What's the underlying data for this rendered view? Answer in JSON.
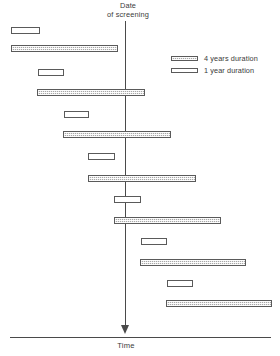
{
  "chart_data": {
    "type": "bar",
    "title": "Date of screening",
    "title_line1": "Date",
    "title_line2": "of screening",
    "xlabel": "Time",
    "ylabel": "",
    "grid": false,
    "orientation": "horizontal",
    "legend_position": "top-right",
    "screening_line_x": 126,
    "legend": [
      {
        "key": "four-year",
        "label": "4 years duration",
        "fill": "hatched-gray",
        "color": "#a8a8a8"
      },
      {
        "key": "one-year",
        "label": "1 year duration",
        "fill": "white",
        "color": "#ffffff"
      }
    ],
    "categories": [
      "case-1-1yr",
      "case-1-4yr",
      "case-2-1yr",
      "case-2-4yr",
      "case-3-1yr",
      "case-3-4yr",
      "case-4-1yr",
      "case-4-4yr",
      "case-5-1yr",
      "case-5-4yr",
      "case-6-1yr",
      "case-6-4yr",
      "case-7-1yr",
      "case-7-4yr"
    ],
    "bars": [
      {
        "index": 1,
        "duration": "1 year",
        "type": "one-year",
        "x": 11,
        "y": 27,
        "width": 29,
        "height": 7,
        "crosses_screening": false
      },
      {
        "index": 2,
        "duration": "4 years",
        "type": "four-year",
        "x": 11,
        "y": 45,
        "width": 107,
        "height": 7,
        "crosses_screening": false
      },
      {
        "index": 3,
        "duration": "1 year",
        "type": "one-year",
        "x": 38,
        "y": 69,
        "width": 26,
        "height": 7,
        "crosses_screening": false
      },
      {
        "index": 4,
        "duration": "4 years",
        "type": "four-year",
        "x": 37,
        "y": 89,
        "width": 108,
        "height": 7,
        "crosses_screening": true
      },
      {
        "index": 5,
        "duration": "1 year",
        "type": "one-year",
        "x": 64,
        "y": 111,
        "width": 25,
        "height": 7,
        "crosses_screening": false
      },
      {
        "index": 6,
        "duration": "4 years",
        "type": "four-year",
        "x": 63,
        "y": 131,
        "width": 108,
        "height": 7,
        "crosses_screening": true
      },
      {
        "index": 7,
        "duration": "1 year",
        "type": "one-year",
        "x": 88,
        "y": 153,
        "width": 27,
        "height": 7,
        "crosses_screening": false
      },
      {
        "index": 8,
        "duration": "4 years",
        "type": "four-year",
        "x": 88,
        "y": 175,
        "width": 108,
        "height": 7,
        "crosses_screening": true
      },
      {
        "index": 9,
        "duration": "1 year",
        "type": "one-year",
        "x": 114,
        "y": 196,
        "width": 27,
        "height": 7,
        "crosses_screening": true
      },
      {
        "index": 10,
        "duration": "4 years",
        "type": "four-year",
        "x": 114,
        "y": 217,
        "width": 107,
        "height": 7,
        "crosses_screening": true
      },
      {
        "index": 11,
        "duration": "1 year",
        "type": "one-year",
        "x": 141,
        "y": 238,
        "width": 26,
        "height": 7,
        "crosses_screening": false
      },
      {
        "index": 12,
        "duration": "4 years",
        "type": "four-year",
        "x": 140,
        "y": 259,
        "width": 106,
        "height": 7,
        "crosses_screening": false
      },
      {
        "index": 13,
        "duration": "1 year",
        "type": "one-year",
        "x": 167,
        "y": 280,
        "width": 26,
        "height": 7,
        "crosses_screening": false
      },
      {
        "index": 14,
        "duration": "4 years",
        "type": "four-year",
        "x": 166,
        "y": 300,
        "width": 106,
        "height": 7,
        "crosses_screening": false
      }
    ]
  },
  "colors": {
    "line": "#4a4a4a",
    "bar_stroke": "#5a5a5a",
    "four_year_fill": "#a8a8a8",
    "one_year_fill": "#ffffff",
    "text": "#3a3a3a",
    "background": "#ffffff"
  }
}
